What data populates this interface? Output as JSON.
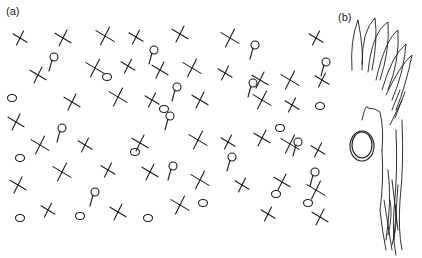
{
  "figure": {
    "panels": [
      {
        "label": "(a)",
        "description": "field of hand-drawn crosses, circles and stalked circles"
      },
      {
        "label": "(b)",
        "description": "hand-drawn tall grass-like strokes with a circle"
      }
    ]
  },
  "panel_a": {
    "crosses": [
      [
        20,
        38
      ],
      [
        63,
        38
      ],
      [
        105,
        36
      ],
      [
        136,
        37
      ],
      [
        180,
        34
      ],
      [
        230,
        38
      ],
      [
        316,
        38
      ],
      [
        38,
        75
      ],
      [
        95,
        68
      ],
      [
        128,
        66
      ],
      [
        160,
        70
      ],
      [
        192,
        68
      ],
      [
        225,
        73
      ],
      [
        260,
        80
      ],
      [
        290,
        80
      ],
      [
        322,
        80
      ],
      [
        72,
        102
      ],
      [
        118,
        97
      ],
      [
        152,
        100
      ],
      [
        200,
        100
      ],
      [
        262,
        100
      ],
      [
        292,
        105
      ],
      [
        16,
        122
      ],
      [
        40,
        145
      ],
      [
        85,
        145
      ],
      [
        140,
        143
      ],
      [
        198,
        140
      ],
      [
        228,
        142
      ],
      [
        262,
        138
      ],
      [
        290,
        144
      ],
      [
        318,
        150
      ],
      [
        18,
        185
      ],
      [
        62,
        172
      ],
      [
        108,
        170
      ],
      [
        150,
        172
      ],
      [
        200,
        180
      ],
      [
        242,
        185
      ],
      [
        282,
        182
      ],
      [
        316,
        190
      ],
      [
        48,
        210
      ],
      [
        118,
        212
      ],
      [
        180,
        205
      ],
      [
        268,
        214
      ],
      [
        320,
        217
      ]
    ],
    "circles": [
      [
        12,
        98
      ],
      [
        107,
        77
      ],
      [
        164,
        109
      ],
      [
        20,
        158
      ],
      [
        135,
        152
      ],
      [
        280,
        128
      ],
      [
        320,
        106
      ],
      [
        20,
        218
      ],
      [
        80,
        216
      ],
      [
        148,
        218
      ],
      [
        203,
        203
      ],
      [
        276,
        194
      ],
      [
        308,
        203
      ]
    ],
    "stalked": [
      [
        52,
        57
      ],
      [
        152,
        50
      ],
      [
        253,
        45
      ],
      [
        324,
        62
      ],
      [
        175,
        87
      ],
      [
        251,
        83
      ],
      [
        60,
        128
      ],
      [
        168,
        116
      ],
      [
        230,
        157
      ],
      [
        296,
        142
      ],
      [
        93,
        192
      ],
      [
        171,
        166
      ],
      [
        313,
        172
      ]
    ]
  }
}
